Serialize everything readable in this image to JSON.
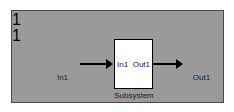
{
  "window": {
    "title": "Simulink Block Diagram",
    "canvas_color": "#9a9a9a",
    "page_background": "#ffffff",
    "line_color": "#000000",
    "block_fill": "#ffffff"
  },
  "blocks": {
    "inport": {
      "type": "Inport",
      "port_number": "1",
      "caption": "In1"
    },
    "subsystem": {
      "type": "Subsystem",
      "caption": "Subsystem",
      "input_label": "In1",
      "output_label": "Out1"
    },
    "outport": {
      "type": "Outport",
      "port_number": "1",
      "caption": "Out1"
    }
  },
  "signals": [
    {
      "name": "signal-inport-to-subsystem",
      "from": "In1",
      "to": "Subsystem"
    },
    {
      "name": "signal-subsystem-to-outport",
      "from": "Subsystem",
      "to": "Out1"
    }
  ]
}
